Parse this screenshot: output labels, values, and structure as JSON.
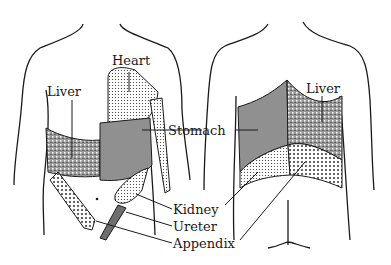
{
  "figure": {
    "views": [
      "front",
      "back"
    ]
  },
  "labels": {
    "heart": "Heart",
    "liver_front": "Liver",
    "liver_back": "Liver",
    "stomach": "Stomach",
    "kidney": "Kidney",
    "ureter": "Ureter",
    "appendix": "Appendix"
  },
  "colors": {
    "outline": "#1a1a1a",
    "heart": "#d9d9d9",
    "liver": "#8a8a8a",
    "stomach": "#9c9c9c",
    "kidney": "#cfcfcf",
    "ureter": "#6e6e6e",
    "appendix": "#c4c4c4"
  }
}
